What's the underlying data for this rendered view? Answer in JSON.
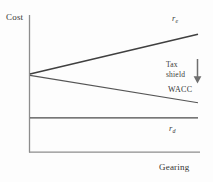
{
  "figure": {
    "axes": {
      "y_label": "Cost",
      "x_label": "Gearing"
    },
    "annotations": {
      "tax_shield": "Tax\nshield",
      "tax_shield_line1": "Tax",
      "tax_shield_line2": "shield",
      "arrow_icon": "down-arrow-icon"
    }
  },
  "chart_data": {
    "type": "line",
    "title": "",
    "xlabel": "Gearing",
    "ylabel": "Cost",
    "xlim": [
      0,
      100
    ],
    "ylim": [
      0,
      100
    ],
    "grid": false,
    "legend": "inline-right-labels",
    "axis_ticks": {
      "x": [],
      "y": []
    },
    "series": [
      {
        "name": "r_e",
        "label": "r",
        "subscript": "e",
        "description": "Cost of equity rises with gearing",
        "color": "#404040",
        "width": 1.6,
        "x": [
          0,
          100
        ],
        "y": [
          57,
          86
        ]
      },
      {
        "name": "WACC",
        "label": "WACC",
        "subscript": "",
        "description": "Weighted average cost of capital falls with gearing",
        "color": "#555555",
        "width": 1.1,
        "x": [
          0,
          100
        ],
        "y": [
          56,
          36
        ]
      },
      {
        "name": "r_d",
        "label": "r",
        "subscript": "d",
        "description": "Cost of debt constant across gearing",
        "color": "#4a4a4a",
        "width": 1.3,
        "x": [
          0,
          100
        ],
        "y": [
          25,
          25
        ]
      }
    ]
  },
  "colors": {
    "background": "#fdfdfd",
    "axis": "#888888",
    "equity_line": "#404040",
    "wacc_line": "#555555",
    "debt_line": "#4a4a4a",
    "text": "#2a2a2a",
    "arrow": "#6a6a6a"
  }
}
